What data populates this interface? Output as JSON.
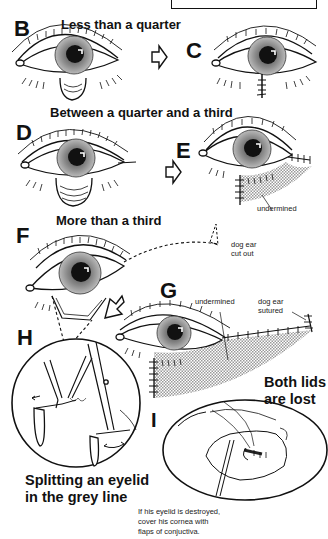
{
  "page": {
    "type": "medical-illustration"
  },
  "panels": {
    "B": {
      "letter": "B",
      "heading": "Less than a quarter"
    },
    "C": {
      "letter": "C"
    },
    "D": {
      "letter": "D",
      "heading": "Between a quarter and a third"
    },
    "E": {
      "letter": "E",
      "label": "undermined"
    },
    "F": {
      "letter": "F",
      "heading": "More than a third",
      "label_line1": "dog ear",
      "label_line2": "cut out"
    },
    "G": {
      "letter": "G",
      "label_undermined": "undermined",
      "label_line1": "dog ear",
      "label_line2": "sutured",
      "note_line1": "Both lids",
      "note_line2": "are lost"
    },
    "H": {
      "letter": "H",
      "caption_line1": "Splitting an eyelid",
      "caption_line2": "in the grey line"
    },
    "I": {
      "letter": "I",
      "caption_line1": "If his eyelid is destroyed,",
      "caption_line2": "cover his cornea with",
      "caption_line3": "flaps of conjuctiva."
    }
  },
  "colors": {
    "ink": "#111111",
    "shading": "#b0b0b0",
    "background": "#ffffff"
  }
}
